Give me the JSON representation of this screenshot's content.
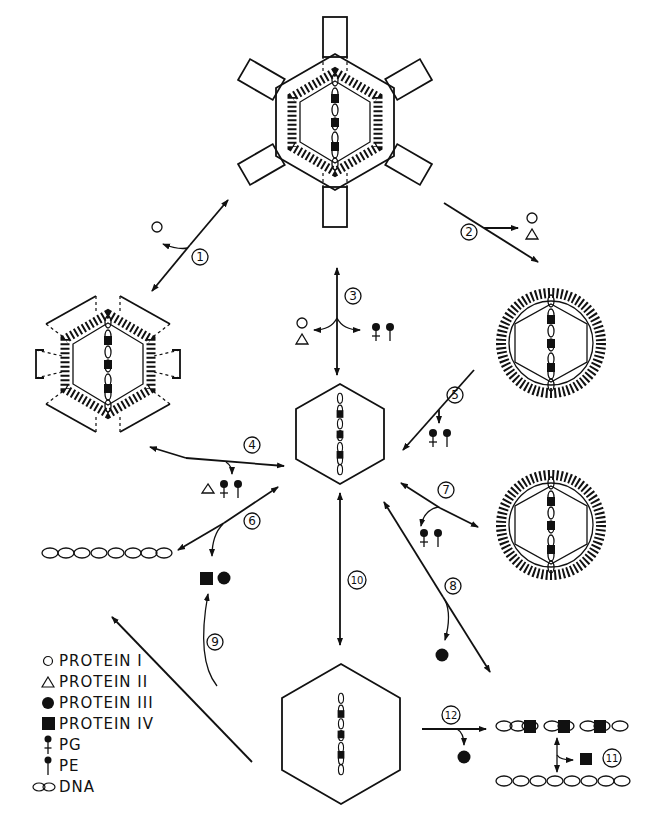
{
  "figure": {
    "type": "pathway-diagram"
  },
  "steps": [
    {
      "id": "1",
      "label": "1",
      "releases": [
        "PROTEIN I"
      ]
    },
    {
      "id": "2",
      "label": "2",
      "releases": [
        "PROTEIN I",
        "PROTEIN II"
      ]
    },
    {
      "id": "3",
      "label": "3",
      "releases": [
        "PROTEIN I",
        "PROTEIN II",
        "PG",
        "PE"
      ]
    },
    {
      "id": "4",
      "label": "4",
      "releases": [
        "PROTEIN II",
        "PG",
        "PE"
      ]
    },
    {
      "id": "5",
      "label": "5",
      "releases": [
        "PG",
        "PE"
      ]
    },
    {
      "id": "6",
      "label": "6",
      "releases": [
        "PROTEIN IV",
        "PROTEIN III"
      ]
    },
    {
      "id": "7",
      "label": "7",
      "releases": [
        "PG",
        "PE"
      ]
    },
    {
      "id": "8",
      "label": "8",
      "releases": [
        "PROTEIN III"
      ]
    },
    {
      "id": "9",
      "label": "9",
      "releases": []
    },
    {
      "id": "10",
      "label": "10",
      "releases": []
    },
    {
      "id": "11",
      "label": "11",
      "releases": [
        "PROTEIN IV"
      ]
    },
    {
      "id": "12",
      "label": "12",
      "releases": [
        "PROTEIN III"
      ]
    }
  ],
  "legend": {
    "items": [
      {
        "symbol": "open-circle",
        "label": "PROTEIN I"
      },
      {
        "symbol": "open-triangle",
        "label": "PROTEIN II"
      },
      {
        "symbol": "filled-circle",
        "label": "PROTEIN III"
      },
      {
        "symbol": "filled-square",
        "label": "PROTEIN IV"
      },
      {
        "symbol": "pg-lipid",
        "label": "PG"
      },
      {
        "symbol": "pe-lipid",
        "label": "PE"
      },
      {
        "symbol": "dna-chain",
        "label": "DNA"
      }
    ]
  }
}
